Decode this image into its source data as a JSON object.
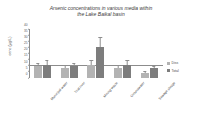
{
  "chart_data": {
    "type": "bar",
    "title": "Arsenic concentrations in various media within the Lake Baikal basin",
    "title_line1": "Arsenic concentrations in various media within",
    "title_line2": "the Lake Baikal basin",
    "xlabel": "",
    "ylabel": "conc (µg/L)",
    "ylim": [
      0,
      40
    ],
    "yticks": [
      0,
      5,
      10,
      15,
      20,
      25,
      30,
      35,
      40
    ],
    "grid": false,
    "legend_position": "right",
    "categories": [
      "Municipal water",
      "Trial river",
      "Mining waste",
      "Groundwater",
      "Sewage sludge"
    ],
    "series": [
      {
        "name": "Diss",
        "color": "#b3b3b3",
        "values": [
          9.5,
          8.5,
          10.5,
          8.5,
          4.0
        ],
        "errors": [
          2.5,
          1.5,
          3.5,
          2.0,
          1.5
        ]
      },
      {
        "name": "Total",
        "color": "#7d7d7d",
        "values": [
          11.0,
          10.0,
          25.0,
          11.0,
          8.5
        ],
        "errors": [
          3.0,
          1.5,
          8.0,
          3.0,
          1.0
        ]
      }
    ]
  },
  "legend": {
    "items": [
      {
        "label": "Diss"
      },
      {
        "label": "Total"
      }
    ]
  }
}
